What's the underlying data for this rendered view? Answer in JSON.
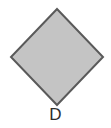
{
  "figure": {
    "shape": "diamond",
    "label": "D",
    "fill_color": "#c4c4c4",
    "stroke_color": "#5a5a5a",
    "background_color": "#ffffff"
  }
}
